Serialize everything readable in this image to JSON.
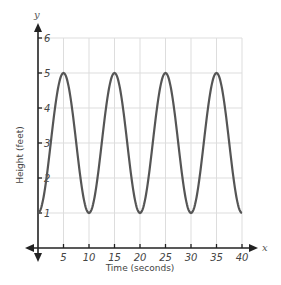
{
  "chart_data": {
    "type": "line",
    "title": "",
    "xlabel": "Time (seconds)",
    "ylabel": "Height  (feet)",
    "x_axis_letter": "x",
    "y_axis_letter": "y",
    "xlim": [
      0,
      40
    ],
    "ylim": [
      0,
      6
    ],
    "x_ticks": [
      5,
      10,
      15,
      20,
      25,
      30,
      35,
      40
    ],
    "y_ticks": [
      1,
      2,
      3,
      4,
      5,
      6
    ],
    "grid": true,
    "legend": null,
    "series": [
      {
        "name": "height",
        "function": "3 - 2*cos(2*pi*t/10)",
        "x": [
          0,
          2.5,
          5,
          7.5,
          10,
          12.5,
          15,
          17.5,
          20,
          22.5,
          25,
          27.5,
          30,
          32.5,
          35,
          37.5,
          40
        ],
        "values": [
          1,
          3,
          5,
          3,
          1,
          3,
          5,
          3,
          1,
          3,
          5,
          3,
          1,
          3,
          5,
          3,
          1
        ],
        "color": "#555555"
      }
    ],
    "annotations": {
      "maxima": [
        [
          5,
          5
        ],
        [
          15,
          5
        ],
        [
          25,
          5
        ],
        [
          35,
          5
        ]
      ],
      "minima": [
        [
          0,
          1
        ],
        [
          10,
          1
        ],
        [
          20,
          1
        ],
        [
          30,
          1
        ],
        [
          40,
          1
        ]
      ]
    }
  },
  "labels": {
    "xlabel": "Time (seconds)",
    "ylabel": "Height  (feet)",
    "x_letter": "x",
    "y_letter": "y"
  }
}
